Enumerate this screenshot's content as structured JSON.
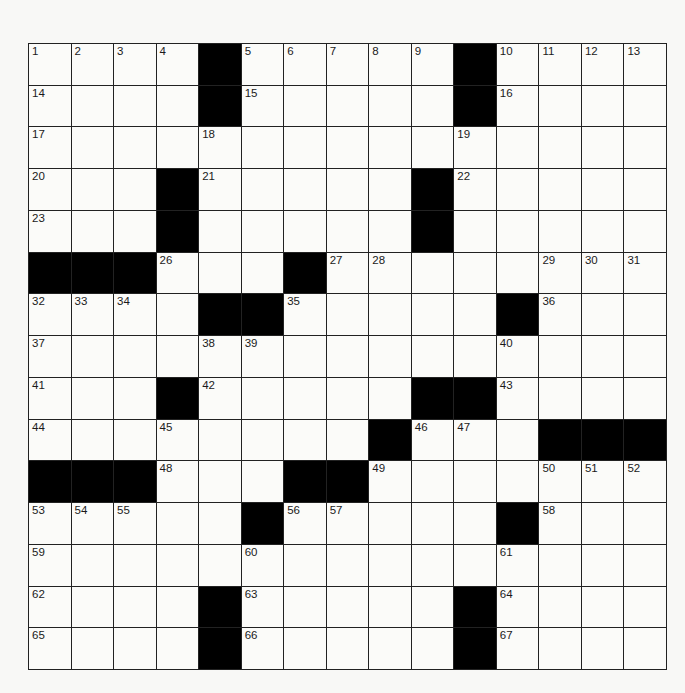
{
  "puzzle": {
    "size": {
      "rows": 15,
      "cols": 15
    },
    "layout": [
      "....#.....#....",
      "....#.....#....",
      "...............",
      "...#.....#.....",
      "...#.....#.....",
      "###...#........",
      "....##.....#...",
      "...............",
      "...#.....##....",
      "........#...###",
      "###...##.......",
      ".....#.....#...",
      "...............",
      "....#.....#....",
      "....#.....#...."
    ],
    "black_cells": [
      [
        0,
        4
      ],
      [
        0,
        10
      ],
      [
        1,
        4
      ],
      [
        1,
        10
      ],
      [
        3,
        3
      ],
      [
        3,
        9
      ],
      [
        4,
        7
      ],
      [
        4,
        8
      ],
      [
        4,
        12
      ],
      [
        4,
        13
      ],
      [
        4,
        14
      ],
      [
        5,
        0
      ],
      [
        5,
        1
      ],
      [
        5,
        2
      ],
      [
        5,
        6
      ],
      [
        6,
        4
      ],
      [
        6,
        5
      ],
      [
        6,
        11
      ],
      [
        8,
        3
      ],
      [
        8,
        9
      ],
      [
        8,
        10
      ],
      [
        9,
        8
      ],
      [
        9,
        12
      ],
      [
        9,
        13
      ],
      [
        9,
        14
      ],
      [
        10,
        0
      ],
      [
        10,
        1
      ],
      [
        10,
        2
      ],
      [
        10,
        6
      ],
      [
        10,
        7
      ],
      [
        11,
        5
      ],
      [
        11,
        11
      ],
      [
        13,
        4
      ],
      [
        13,
        10
      ],
      [
        14,
        4
      ],
      [
        14,
        10
      ]
    ],
    "numbers": [
      {
        "n": "1",
        "r": 0,
        "c": 0
      },
      {
        "n": "2",
        "r": 0,
        "c": 1
      },
      {
        "n": "3",
        "r": 0,
        "c": 2
      },
      {
        "n": "4",
        "r": 0,
        "c": 3
      },
      {
        "n": "5",
        "r": 0,
        "c": 5
      },
      {
        "n": "6",
        "r": 0,
        "c": 6
      },
      {
        "n": "7",
        "r": 0,
        "c": 7
      },
      {
        "n": "8",
        "r": 0,
        "c": 8
      },
      {
        "n": "9",
        "r": 0,
        "c": 9
      },
      {
        "n": "10",
        "r": 0,
        "c": 11
      },
      {
        "n": "11",
        "r": 0,
        "c": 12
      },
      {
        "n": "12",
        "r": 0,
        "c": 13
      },
      {
        "n": "13",
        "r": 0,
        "c": 14
      },
      {
        "n": "14",
        "r": 1,
        "c": 0
      },
      {
        "n": "15",
        "r": 1,
        "c": 5
      },
      {
        "n": "16",
        "r": 1,
        "c": 11
      },
      {
        "n": "17",
        "r": 2,
        "c": 0
      },
      {
        "n": "18",
        "r": 2,
        "c": 4
      },
      {
        "n": "19",
        "r": 2,
        "c": 10
      },
      {
        "n": "20",
        "r": 3,
        "c": 0
      },
      {
        "n": "21",
        "r": 3,
        "c": 4
      },
      {
        "n": "22",
        "r": 3,
        "c": 10
      },
      {
        "n": "23",
        "r": 4,
        "c": 0
      },
      {
        "n": "24",
        "r": 4,
        "c": 3
      },
      {
        "n": "25",
        "r": 4,
        "c": 9
      },
      {
        "n": "26",
        "r": 5,
        "c": 3
      },
      {
        "n": "27",
        "r": 5,
        "c": 7
      },
      {
        "n": "28",
        "r": 5,
        "c": 8
      },
      {
        "n": "29",
        "r": 5,
        "c": 12
      },
      {
        "n": "30",
        "r": 5,
        "c": 13
      },
      {
        "n": "31",
        "r": 5,
        "c": 14
      },
      {
        "n": "32",
        "r": 6,
        "c": 0
      },
      {
        "n": "33",
        "r": 6,
        "c": 1
      },
      {
        "n": "34",
        "r": 6,
        "c": 2
      },
      {
        "n": "35",
        "r": 6,
        "c": 6
      },
      {
        "n": "36",
        "r": 6,
        "c": 12
      },
      {
        "n": "37",
        "r": 7,
        "c": 0
      },
      {
        "n": "38",
        "r": 7,
        "c": 4
      },
      {
        "n": "39",
        "r": 7,
        "c": 5
      },
      {
        "n": "40",
        "r": 7,
        "c": 11
      },
      {
        "n": "41",
        "r": 8,
        "c": 0
      },
      {
        "n": "42",
        "r": 8,
        "c": 4
      },
      {
        "n": "43",
        "r": 8,
        "c": 11
      },
      {
        "n": "44",
        "r": 9,
        "c": 0
      },
      {
        "n": "45",
        "r": 9,
        "c": 3
      },
      {
        "n": "46",
        "r": 9,
        "c": 9
      },
      {
        "n": "47",
        "r": 9,
        "c": 10
      },
      {
        "n": "48",
        "r": 10,
        "c": 3
      },
      {
        "n": "49",
        "r": 10,
        "c": 8
      },
      {
        "n": "50",
        "r": 10,
        "c": 12
      },
      {
        "n": "51",
        "r": 10,
        "c": 13
      },
      {
        "n": "52",
        "r": 10,
        "c": 14
      },
      {
        "n": "53",
        "r": 11,
        "c": 0
      },
      {
        "n": "54",
        "r": 11,
        "c": 1
      },
      {
        "n": "55",
        "r": 11,
        "c": 2
      },
      {
        "n": "56",
        "r": 11,
        "c": 6
      },
      {
        "n": "57",
        "r": 11,
        "c": 7
      },
      {
        "n": "58",
        "r": 11,
        "c": 12
      },
      {
        "n": "59",
        "r": 12,
        "c": 0
      },
      {
        "n": "60",
        "r": 12,
        "c": 5
      },
      {
        "n": "61",
        "r": 12,
        "c": 11
      },
      {
        "n": "62",
        "r": 13,
        "c": 0
      },
      {
        "n": "63",
        "r": 13,
        "c": 5
      },
      {
        "n": "64",
        "r": 13,
        "c": 11
      },
      {
        "n": "65",
        "r": 14,
        "c": 0
      },
      {
        "n": "66",
        "r": 14,
        "c": 5
      },
      {
        "n": "67",
        "r": 14,
        "c": 11
      }
    ],
    "colors": {
      "black_square": "#000000",
      "white_square": "#fbfbf9",
      "grid_line": "#222222",
      "number_text": "#1a1a1a"
    }
  }
}
